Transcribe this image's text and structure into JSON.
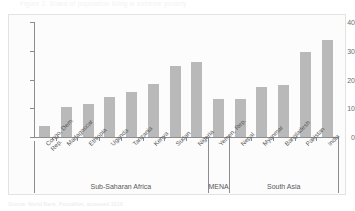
{
  "figure": {
    "title": "Figure 2. Share of population living in extreme poverty",
    "source": "Source: World Bank, PovcalNet, accessed 2019."
  },
  "chart_data": {
    "type": "bar",
    "title": "",
    "xlabel": "",
    "ylabel": "",
    "ylim": [
      0,
      40
    ],
    "yticks": [
      0,
      10,
      20,
      30,
      40
    ],
    "ytick_labels": [
      "0",
      "10",
      "20",
      "30",
      "40"
    ],
    "grid": false,
    "legend": null,
    "bar_color": "#b9b9b9",
    "axis_color": "#8d8d8f",
    "categories": [
      "Congo, Dem. Rep.",
      "Madagascar",
      "Ethiopia",
      "Uganda",
      "Tanzania",
      "Kenya",
      "Sudan",
      "Nigeria",
      "Yemen, Rep.",
      "Nepal",
      "Myanmar",
      "Bangladesh",
      "Pakistan",
      "India"
    ],
    "category_lines": [
      [
        "Congo, Dem.",
        "Rep."
      ],
      [
        "Madagascar"
      ],
      [
        "Ethiopia"
      ],
      [
        "Uganda"
      ],
      [
        "Tanzania"
      ],
      [
        "Kenya"
      ],
      [
        "Sudan"
      ],
      [
        "Nigeria"
      ],
      [
        "Yemen, Rep."
      ],
      [
        "Nepal"
      ],
      [
        "Myanmar"
      ],
      [
        "Bangladesh"
      ],
      [
        "Pakistan"
      ],
      [
        "India"
      ]
    ],
    "values": [
      3.7,
      10.6,
      11.4,
      13.9,
      15.6,
      18.6,
      24.8,
      26.2,
      13.3,
      13.1,
      17.4,
      18.1,
      29.4,
      33.8
    ],
    "groups": [
      {
        "label": "Sub-Saharan Africa",
        "start": 0,
        "end": 7
      },
      {
        "label": "MENA",
        "start": 8,
        "end": 8
      },
      {
        "label": "South Asia",
        "start": 9,
        "end": 13
      }
    ]
  }
}
